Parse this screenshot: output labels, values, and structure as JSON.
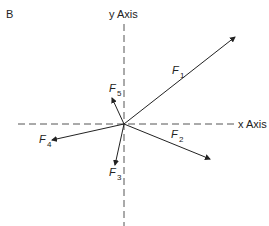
{
  "panel_label": "B",
  "axes": {
    "x_label": "x Axis",
    "y_label": "y Axis"
  },
  "forces": [
    {
      "name": "F",
      "sub": "1"
    },
    {
      "name": "F",
      "sub": "2"
    },
    {
      "name": "F",
      "sub": "3"
    },
    {
      "name": "F",
      "sub": "4"
    },
    {
      "name": "F",
      "sub": "5"
    }
  ],
  "colors": {
    "stroke": "#222222"
  }
}
